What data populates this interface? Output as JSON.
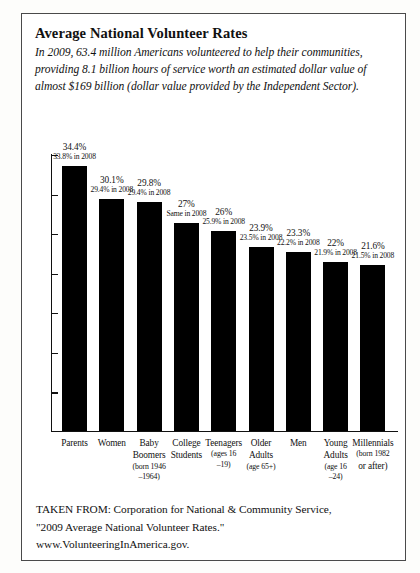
{
  "header": {
    "title": "Average National Volunteer Rates",
    "intro_lines": [
      "In 2009, 63.4 million Americans volunteered to help their communities,",
      "providing 8.1 billion hours of service worth an estimated dollar value of",
      "almost $169 billion (dollar value provided by the Independent Sector)."
    ]
  },
  "footer": {
    "lines": [
      "TAKEN FROM: Corporation for National & Community Service,",
      "\"2009 Average National Volunteer Rates.\"",
      "www.VolunteeringInAmerica.gov."
    ]
  },
  "chart_data": {
    "type": "bar",
    "title": "Average National Volunteer Rates",
    "xlabel": "",
    "ylabel": "",
    "ylim": [
      0,
      36
    ],
    "grid": false,
    "legend": "none",
    "orientation": "vertical",
    "bar_color": "#000000",
    "categories": [
      "Parents",
      "Women",
      "Baby Boomers",
      "College Students",
      "Teenagers",
      "Older Adults",
      "Men",
      "Young Adults",
      "Millennials"
    ],
    "category_lines": [
      [
        "Parents",
        "",
        ""
      ],
      [
        "Women",
        "",
        ""
      ],
      [
        "Baby",
        "Boomers",
        "(born 1946",
        "–1964)"
      ],
      [
        "College",
        "Students",
        "",
        ""
      ],
      [
        "Teenagers",
        "(ages 16",
        "–19)"
      ],
      [
        "Older",
        "Adults",
        "(age 65+)"
      ],
      [
        "Men",
        "",
        ""
      ],
      [
        "Young",
        "Adults",
        "(age 16",
        "–24)"
      ],
      [
        "Millennials",
        "(born 1982",
        "or after)"
      ]
    ],
    "values": [
      34.4,
      30.1,
      29.8,
      27,
      26,
      23.9,
      23.3,
      22,
      21.6
    ],
    "value_labels": [
      "34.4%",
      "30.1%",
      "29.8%",
      "27%",
      "26%",
      "23.9%",
      "23.3%",
      "22%",
      "21.6%"
    ],
    "comparison_labels": [
      "33.8% in 2008",
      "29.4% in 2008",
      "29.4% in 2008",
      "Same in 2008",
      "25.9% in 2008",
      "23.5% in 2008",
      "22.2% in 2008",
      "21.9% in 2008",
      "21.5% in 2008"
    ],
    "series": [
      {
        "name": "2009",
        "values": [
          34.4,
          30.1,
          29.8,
          27,
          26,
          23.9,
          23.3,
          22,
          21.6
        ]
      },
      {
        "name": "2008",
        "values": [
          33.8,
          29.4,
          29.4,
          27,
          25.9,
          23.5,
          22.2,
          21.9,
          21.5
        ]
      }
    ]
  }
}
